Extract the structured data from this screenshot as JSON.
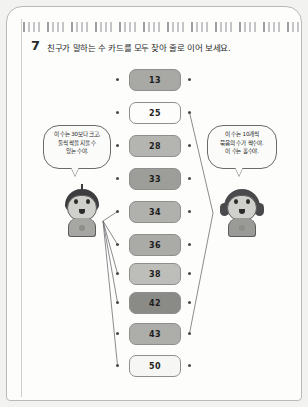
{
  "page": {
    "question_number": "7",
    "title": "친구가 말하는 수 카드를 모두 찾아 줄로 이어 보세요."
  },
  "cards": [
    {
      "value": "13",
      "fill": "#a8a8a4",
      "top": 62
    },
    {
      "value": "25",
      "fill": "#fdfdfc",
      "top": 95
    },
    {
      "value": "28",
      "fill": "#b4b4b0",
      "top": 128
    },
    {
      "value": "33",
      "fill": "#9d9d99",
      "top": 161
    },
    {
      "value": "34",
      "fill": "#b0b0ac",
      "top": 194
    },
    {
      "value": "36",
      "fill": "#aaaaa6",
      "top": 227
    },
    {
      "value": "38",
      "fill": "#bdbdb9",
      "top": 256
    },
    {
      "value": "42",
      "fill": "#8a8a86",
      "top": 285
    },
    {
      "value": "43",
      "fill": "#adadaa",
      "top": 316
    },
    {
      "value": "50",
      "fill": "#f6f6f4",
      "top": 348
    }
  ],
  "bubbles": {
    "left": {
      "lines": [
        "이 수는 30보다 크고,",
        "둘씩 짝을 지을 수",
        "있는 수야."
      ]
    },
    "right": {
      "lines": [
        "이 수는 10개씩",
        "묶음의 수가 짝수야.",
        "이 수는 홀수야."
      ]
    }
  },
  "characters": {
    "boy": "boy-character",
    "girl": "girl-character"
  },
  "connections": {
    "boy_to_cards": [
      "34",
      "36",
      "38",
      "42",
      "50"
    ],
    "cards_to_girl": [
      "25",
      "43"
    ]
  },
  "colors": {
    "line": "#6f6f74",
    "dot": "#4a4a4a",
    "card_border": "#8e8e8e",
    "text": "#232323"
  }
}
